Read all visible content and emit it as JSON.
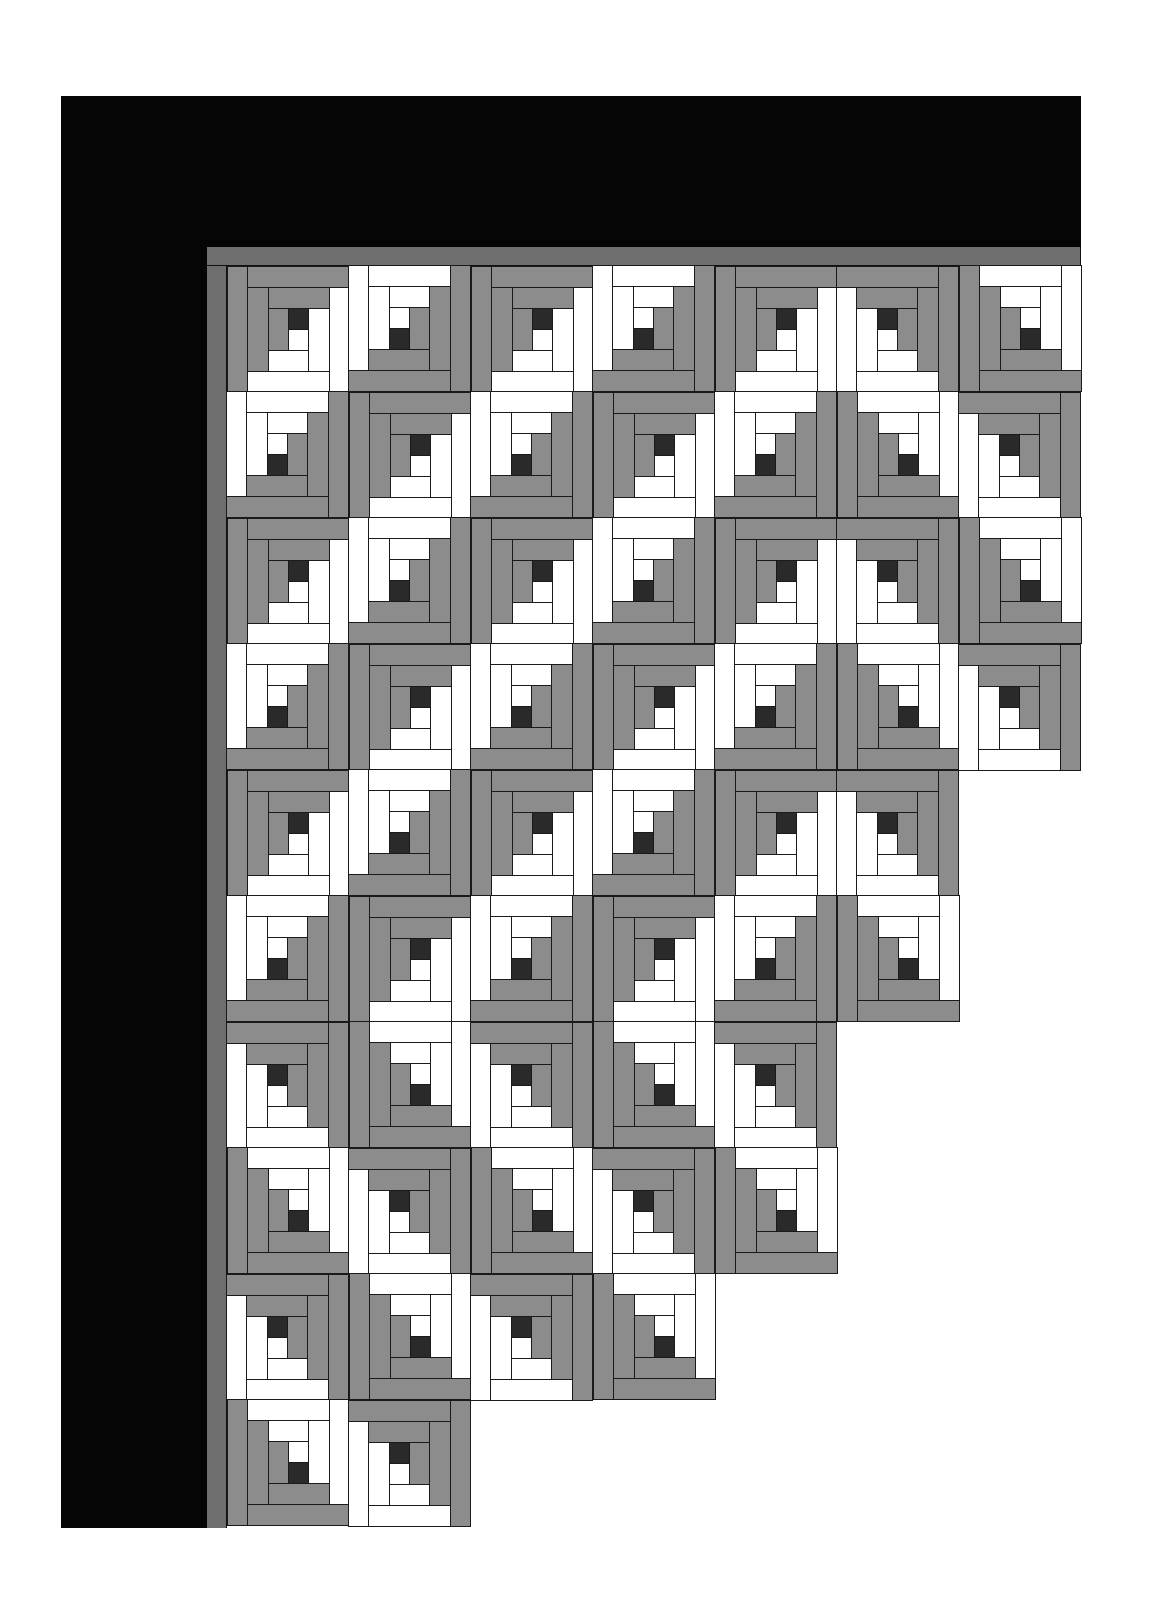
{
  "title": "",
  "colors": {
    "border_outer": "#050505",
    "border_inner": "#6e6e6e",
    "gray_log": "#8c8c8c",
    "light_log": "#ffffff",
    "center": "#2a2a2a",
    "seam": "#1a1a1a",
    "background": "#ffffff"
  },
  "quilt": {
    "pattern": "log cabin",
    "unit_grid": 6,
    "block_size_px": [
      122,
      126
    ],
    "origin_px": [
      227,
      266
    ],
    "rows": [
      {
        "row": 1,
        "blocks": [
          "TL",
          "BR",
          "TL",
          "BR",
          "TL",
          "TR",
          "BL"
        ]
      },
      {
        "row": 2,
        "blocks": [
          "BR",
          "TL",
          "BR",
          "TL",
          "BR",
          "BL",
          "TR"
        ]
      },
      {
        "row": 3,
        "blocks": [
          "TL",
          "BR",
          "TL",
          "BR",
          "TL",
          "TR",
          "BL"
        ]
      },
      {
        "row": 4,
        "blocks": [
          "BR",
          "TL",
          "BR",
          "TL",
          "BR",
          "BL",
          "TR"
        ]
      },
      {
        "row": 5,
        "blocks": [
          "TL",
          "BR",
          "TL",
          "BR",
          "TL",
          "TR"
        ]
      },
      {
        "row": 6,
        "blocks": [
          "BR",
          "TL",
          "BR",
          "TL",
          "BR",
          "BL"
        ]
      },
      {
        "row": 7,
        "blocks": [
          "TR",
          "BL",
          "TR",
          "BL",
          "TR"
        ]
      },
      {
        "row": 8,
        "blocks": [
          "BL",
          "TR",
          "BL",
          "TR",
          "BL"
        ]
      },
      {
        "row": 9,
        "blocks": [
          "TR",
          "BL",
          "TR",
          "BL"
        ]
      },
      {
        "row": 10,
        "blocks": [
          "BL",
          "TR"
        ]
      }
    ],
    "canonical_block_logs": [
      {
        "c": 3,
        "r": 2,
        "w": 1,
        "h": 1,
        "tone": "center"
      },
      {
        "c": 3,
        "r": 3,
        "w": 1,
        "h": 1,
        "tone": "light"
      },
      {
        "c": 2,
        "r": 2,
        "w": 1,
        "h": 2,
        "tone": "gray"
      },
      {
        "c": 2,
        "r": 1,
        "w": 3,
        "h": 1,
        "tone": "gray"
      },
      {
        "c": 4,
        "r": 2,
        "w": 1,
        "h": 3,
        "tone": "light"
      },
      {
        "c": 2,
        "r": 4,
        "w": 2,
        "h": 1,
        "tone": "light"
      },
      {
        "c": 1,
        "r": 1,
        "w": 1,
        "h": 4,
        "tone": "gray"
      },
      {
        "c": 1,
        "r": 0,
        "w": 5,
        "h": 1,
        "tone": "gray"
      },
      {
        "c": 5,
        "r": 1,
        "w": 1,
        "h": 5,
        "tone": "light"
      },
      {
        "c": 1,
        "r": 5,
        "w": 4,
        "h": 1,
        "tone": "light"
      },
      {
        "c": 0,
        "r": 0,
        "w": 1,
        "h": 6,
        "tone": "gray"
      }
    ]
  }
}
